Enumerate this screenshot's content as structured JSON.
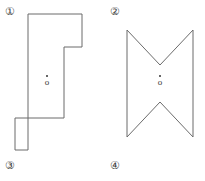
{
  "figure": {
    "width": 205,
    "height": 181,
    "background_color": "#ffffff",
    "stroke_color": "#6b6b6b",
    "text_color": "#3a3a3a"
  },
  "labels": [
    {
      "id": "label-1",
      "text": "①",
      "number": "1",
      "position": "top-left"
    },
    {
      "id": "label-2",
      "text": "②",
      "number": "2",
      "position": "top-right"
    },
    {
      "id": "label-3",
      "text": "③",
      "number": "3",
      "position": "bottom-left"
    },
    {
      "id": "label-4",
      "text": "④",
      "number": "4",
      "position": "bottom-right"
    }
  ],
  "shapes": [
    {
      "id": "shape-left",
      "name": "notched-rectilinear-polygon",
      "kind": "orthogonal-polygon",
      "points": "28,14 82,14 82,47 64,47 64,118 28,118 28,150 15,150 15,118 28,118 28,14",
      "outline": "28,14 82,14 82,47 64,47 64,118 28,118 28,150 15,150 15,118",
      "vertices": [
        [
          28,
          14
        ],
        [
          82,
          14
        ],
        [
          82,
          47
        ],
        [
          64,
          47
        ],
        [
          64,
          150
        ],
        [
          15,
          150
        ],
        [
          15,
          118
        ],
        [
          28,
          118
        ]
      ]
    },
    {
      "id": "shape-right",
      "name": "bowtie-hourglass-polygon",
      "kind": "concave-polygon",
      "vertices": [
        [
          127,
          30
        ],
        [
          160,
          65
        ],
        [
          193,
          30
        ],
        [
          193,
          137
        ],
        [
          160,
          102
        ],
        [
          127,
          137
        ]
      ]
    }
  ],
  "centroid_markers": [
    {
      "id": "centroid-left",
      "dot": "·",
      "glyph": "o",
      "for_shape": "shape-left"
    },
    {
      "id": "centroid-right",
      "dot": "·",
      "glyph": "o",
      "for_shape": "shape-right"
    }
  ]
}
